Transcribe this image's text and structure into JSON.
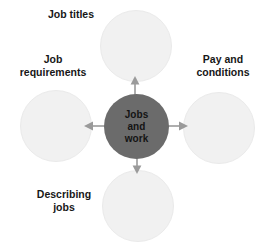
{
  "diagram": {
    "type": "hub-and-spoke",
    "background_color": "#ffffff",
    "center": {
      "id": "jobs-and-work",
      "fill_color": "#6b6b6b",
      "text_color": "#141414",
      "lines": [
        "Jobs",
        "and",
        "work"
      ]
    },
    "satellite_fill_color": "#f1f1f1",
    "satellite_border_color": "#eaeaea",
    "label_color": "#171717",
    "arrow_color": "#9a9a9a",
    "nodes": [
      {
        "id": "job-titles",
        "position": "top",
        "label_lines": [
          "Job titles"
        ],
        "arrow": "arrow-up-icon"
      },
      {
        "id": "pay-and-conditions",
        "position": "right",
        "label_lines": [
          "Pay and",
          "conditions"
        ],
        "arrow": "arrow-right-icon"
      },
      {
        "id": "describing-jobs",
        "position": "bottom",
        "label_lines": [
          "Describing",
          "jobs"
        ],
        "arrow": "arrow-down-icon"
      },
      {
        "id": "job-requirements",
        "position": "left",
        "label_lines": [
          "Job",
          "requirements"
        ],
        "arrow": "arrow-left-icon"
      }
    ]
  }
}
